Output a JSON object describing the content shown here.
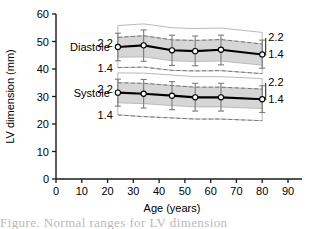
{
  "chart_data": {
    "type": "line",
    "title": "",
    "xlabel": "Age (years)",
    "ylabel": "LV dimension (mm)",
    "xlim": [
      0,
      90
    ],
    "ylim": [
      0,
      60
    ],
    "xticks": [
      0,
      10,
      20,
      30,
      40,
      50,
      60,
      70,
      80,
      90
    ],
    "yticks": [
      0,
      10,
      20,
      30,
      40,
      50,
      60
    ],
    "grid": false,
    "legend_position": "inline-labels",
    "x": [
      24,
      34,
      45,
      54,
      64,
      80
    ],
    "series": [
      {
        "name": "Diastole",
        "label": "Diastole",
        "values": [
          48.0,
          48.6,
          46.8,
          46.5,
          47.0,
          45.3
        ],
        "err_low": [
          43.0,
          42.8,
          41.3,
          41.2,
          41.5,
          40.3
        ],
        "err_high": [
          53.0,
          54.2,
          52.3,
          52.0,
          52.3,
          50.5
        ],
        "band_gray_low": [
          44.3,
          44.4,
          43.0,
          42.7,
          42.9,
          41.4
        ],
        "band_gray_high": [
          51.5,
          52.1,
          50.6,
          50.4,
          50.7,
          49.1
        ],
        "band_outer_low": [
          40.5,
          40.7,
          39.5,
          39.3,
          39.4,
          38.3
        ],
        "band_outer_high": [
          55.8,
          56.4,
          55.0,
          54.7,
          54.9,
          53.3
        ],
        "dashed_upper_label": "2.2",
        "dashed_lower_label": "1.4",
        "dashed_upper": [
          51.5,
          52.1,
          50.6,
          50.4,
          50.7,
          49.1
        ],
        "dashed_lower": [
          40.5,
          40.7,
          39.5,
          39.3,
          39.4,
          38.3
        ],
        "left_label_upper": "2.2",
        "left_label_lower": "1.4",
        "right_label_upper": "2.2",
        "right_label_lower": "1.4"
      },
      {
        "name": "Systole",
        "label": "Systole",
        "values": [
          31.4,
          31.0,
          30.3,
          29.7,
          29.7,
          29.0
        ],
        "err_low": [
          26.5,
          25.8,
          25.2,
          24.7,
          24.7,
          24.2
        ],
        "err_high": [
          36.3,
          36.2,
          35.4,
          34.8,
          34.8,
          33.9
        ],
        "band_gray_low": [
          27.7,
          27.4,
          26.7,
          26.2,
          26.2,
          25.6
        ],
        "band_gray_high": [
          35.0,
          34.8,
          34.0,
          33.4,
          33.4,
          32.7
        ],
        "band_outer_low": [
          23.3,
          22.7,
          22.2,
          21.8,
          21.8,
          21.2
        ],
        "band_outer_high": [
          38.6,
          38.5,
          37.8,
          37.2,
          37.2,
          36.5
        ],
        "dashed_upper_label": "2.2",
        "dashed_lower_label": "1.4",
        "dashed_upper": [
          35.0,
          34.8,
          34.0,
          33.4,
          33.4,
          32.7
        ],
        "dashed_lower": [
          23.3,
          22.7,
          22.2,
          21.8,
          21.8,
          21.2
        ],
        "left_label_upper": "2.2",
        "left_label_lower": "1.4",
        "right_label_upper": "2.2",
        "right_label_lower": "1.4"
      }
    ],
    "colors": {
      "mean_line": "#000000",
      "band_fill": "#d4d4d4",
      "band_outer_fill": "#ffffff",
      "band_edge": "#a8a8a8",
      "dashed_line": "#6e6e6e",
      "error_bar": "#7a7a7a",
      "marker_face": "#ffffff",
      "marker_edge": "#000000",
      "axis": "#1a1a1a"
    }
  },
  "caption": {
    "text": "Figure. Normal ranges for LV dimension"
  }
}
